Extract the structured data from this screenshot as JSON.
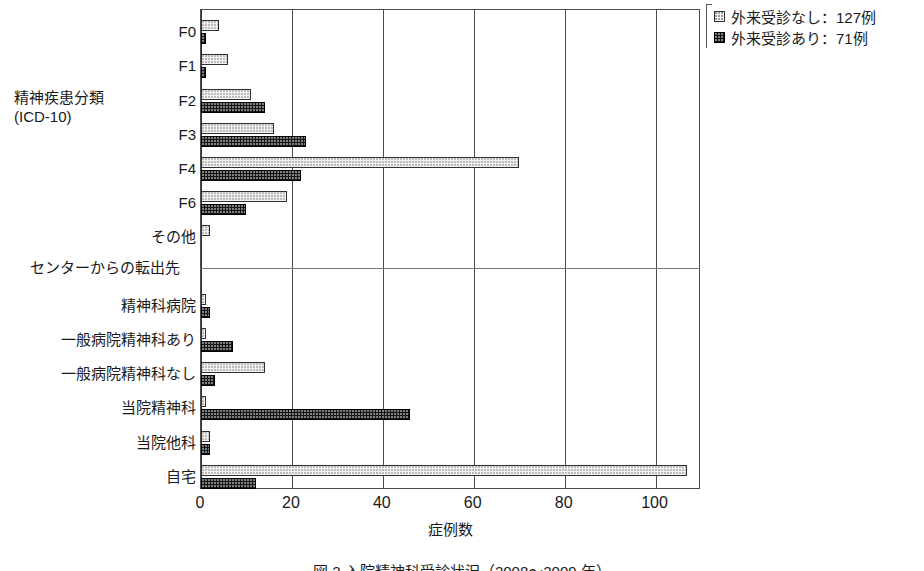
{
  "chart_data": {
    "type": "bar",
    "orientation": "horizontal",
    "title": "",
    "xlabel": "症例数",
    "ylabel": "",
    "xlim": [
      0,
      110
    ],
    "xticks": [
      0,
      20,
      40,
      60,
      80,
      100
    ],
    "grid": true,
    "legend_position": "top-right",
    "group_labels": [
      "精神疾患分類\n(ICD-10)",
      "センターからの転出先"
    ],
    "groups": [
      {
        "name": "精神疾患分類 (ICD-10)",
        "caption_line1": "精神疾患分類",
        "caption_line2": "(ICD-10)",
        "categories": [
          "F0",
          "F1",
          "F2",
          "F3",
          "F4",
          "F6",
          "その他"
        ]
      },
      {
        "name": "センターからの転出先",
        "caption_line1": "センターからの転出先",
        "caption_line2": "",
        "categories": [
          "精神科病院",
          "一般病院精神科あり",
          "一般病院精神科なし",
          "当院精神科",
          "当院他科",
          "自宅"
        ]
      }
    ],
    "categories": [
      "F0",
      "F1",
      "F2",
      "F3",
      "F4",
      "F6",
      "その他",
      "精神科病院",
      "一般病院精神科あり",
      "一般病院精神科なし",
      "当院精神科",
      "当院他科",
      "自宅"
    ],
    "series": [
      {
        "name": "外来受診なし：127例",
        "short_name": "外来受診なし",
        "total": 127,
        "pattern": "light-dotted",
        "color": "#f2f2f2",
        "values": [
          4,
          6,
          11,
          16,
          70,
          19,
          2,
          1,
          1,
          14,
          1,
          2,
          107
        ]
      },
      {
        "name": "外来受診あり：71例",
        "short_name": "外来受診あり",
        "total": 71,
        "pattern": "dark-dotted",
        "color": "#151515",
        "values": [
          1,
          1,
          14,
          23,
          22,
          10,
          0,
          2,
          7,
          3,
          46,
          2,
          12
        ]
      }
    ]
  },
  "legend": {
    "items": [
      {
        "label": "外来受診なし：127例",
        "swatch": "light-dotted-swatch"
      },
      {
        "label": "外来受診あり：71例",
        "swatch": "dark-dotted-swatch"
      }
    ]
  },
  "axis": {
    "x_title": "症例数",
    "tick_labels": [
      "0",
      "20",
      "40",
      "60",
      "80",
      "100"
    ]
  },
  "caption": {
    "text": "図 2  入院精神科受診状況（2008〜2009 年）",
    "clipped": true
  }
}
